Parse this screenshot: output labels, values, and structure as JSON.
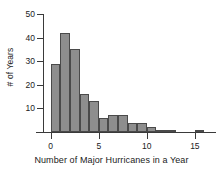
{
  "chart_data": {
    "type": "bar",
    "title": "",
    "xlabel": "Number of Major Hurricanes in a Year",
    "ylabel": "# of Years",
    "categories": [
      "0",
      "1",
      "2",
      "3",
      "4",
      "5",
      "6",
      "7",
      "8",
      "9",
      "10",
      "11",
      "12",
      "13",
      "14",
      "15"
    ],
    "values": [
      29,
      42,
      35,
      16,
      13,
      6,
      7,
      7,
      4,
      4,
      2,
      1,
      1,
      0,
      0,
      1
    ],
    "bin_width": 1,
    "bin_starts": [
      0,
      1,
      2,
      3,
      4,
      5,
      6,
      7,
      8,
      9,
      10,
      11,
      12,
      13,
      14,
      15
    ],
    "xtick_labels": [
      "0",
      "5",
      "10",
      "15"
    ],
    "xtick_values": [
      0,
      5,
      10,
      15
    ],
    "ytick_labels": [
      "10",
      "20",
      "30",
      "40",
      "50"
    ],
    "ytick_values": [
      10,
      20,
      30,
      40,
      50
    ],
    "xlim": [
      -0.7,
      17.2
    ],
    "ylim": [
      0,
      50
    ],
    "grid": false,
    "legend": false,
    "bar_color": "#8e8e8e",
    "bar_edge_color": "#4a4a4a",
    "axis_color": "#3a3a3a"
  }
}
